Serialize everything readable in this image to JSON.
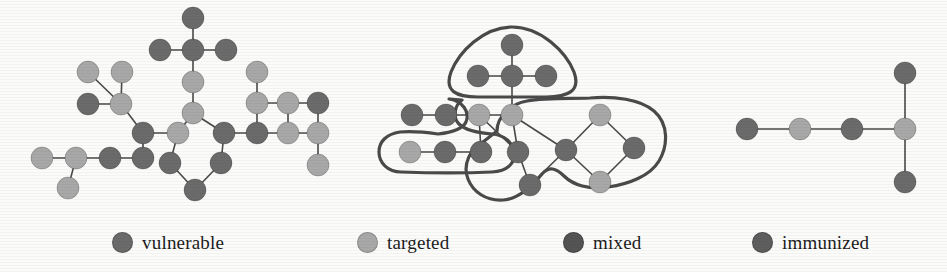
{
  "figure": {
    "title": "",
    "background_color": "#fbfbfa",
    "node_radius": 11,
    "edge_color": "#4a4a4a",
    "edge_width": 1.6,
    "blob_color": "#4a4a4a",
    "blob_width": 3.2
  },
  "colors": {
    "vulnerable": "#6b6b6b",
    "targeted": "#a8a8a8",
    "mixed": "#545454",
    "immunized": "#5e5e5e",
    "dark": "#6b6b6b",
    "light": "#a8a8a8",
    "edge": "#4a4a4a",
    "outline": "#4a4a4a"
  },
  "legend": {
    "items": [
      {
        "label": "vulnerable",
        "color": "#6b6b6b",
        "x": 112,
        "swatch": "circle-marker"
      },
      {
        "label": "targeted",
        "color": "#a8a8a8",
        "x": 357,
        "swatch": "circle-marker"
      },
      {
        "label": "mixed",
        "color": "#545454",
        "x": 563,
        "swatch": "circle-marker"
      },
      {
        "label": "immunized",
        "color": "#5e5e5e",
        "x": 752,
        "swatch": "circle-marker"
      }
    ]
  },
  "panels": [
    {
      "name": "panel-left",
      "caption": "",
      "blobs": [],
      "nodes": [
        {
          "id": "L1",
          "x": 193,
          "y": 18,
          "type": "dark"
        },
        {
          "id": "L2",
          "x": 160,
          "y": 50,
          "type": "dark"
        },
        {
          "id": "L3",
          "x": 193,
          "y": 50,
          "type": "dark"
        },
        {
          "id": "L4",
          "x": 226,
          "y": 50,
          "type": "dark"
        },
        {
          "id": "L5",
          "x": 193,
          "y": 82,
          "type": "light"
        },
        {
          "id": "L6",
          "x": 193,
          "y": 113,
          "type": "light"
        },
        {
          "id": "L7",
          "x": 88,
          "y": 72,
          "type": "light"
        },
        {
          "id": "L8",
          "x": 122,
          "y": 72,
          "type": "light"
        },
        {
          "id": "L9",
          "x": 88,
          "y": 104,
          "type": "dark"
        },
        {
          "id": "L10",
          "x": 121,
          "y": 104,
          "type": "light"
        },
        {
          "id": "L11",
          "x": 143,
          "y": 133,
          "type": "dark"
        },
        {
          "id": "L12",
          "x": 178,
          "y": 133,
          "type": "light"
        },
        {
          "id": "L13",
          "x": 42,
          "y": 158,
          "type": "light"
        },
        {
          "id": "L14",
          "x": 76,
          "y": 158,
          "type": "light"
        },
        {
          "id": "L15",
          "x": 68,
          "y": 188,
          "type": "light"
        },
        {
          "id": "L16",
          "x": 110,
          "y": 158,
          "type": "dark"
        },
        {
          "id": "L17",
          "x": 143,
          "y": 158,
          "type": "dark"
        },
        {
          "id": "L18",
          "x": 170,
          "y": 163,
          "type": "dark"
        },
        {
          "id": "L19",
          "x": 195,
          "y": 190,
          "type": "dark"
        },
        {
          "id": "L20",
          "x": 221,
          "y": 163,
          "type": "dark"
        },
        {
          "id": "L21",
          "x": 224,
          "y": 133,
          "type": "dark"
        },
        {
          "id": "L22",
          "x": 257,
          "y": 133,
          "type": "dark"
        },
        {
          "id": "L23",
          "x": 257,
          "y": 103,
          "type": "light"
        },
        {
          "id": "L24",
          "x": 257,
          "y": 72,
          "type": "light"
        },
        {
          "id": "L25",
          "x": 288,
          "y": 103,
          "type": "light"
        },
        {
          "id": "L26",
          "x": 288,
          "y": 133,
          "type": "light"
        },
        {
          "id": "L27",
          "x": 318,
          "y": 103,
          "type": "dark"
        },
        {
          "id": "L28",
          "x": 318,
          "y": 133,
          "type": "light"
        },
        {
          "id": "L29",
          "x": 318,
          "y": 165,
          "type": "light"
        }
      ],
      "edges": [
        [
          "L1",
          "L3"
        ],
        [
          "L2",
          "L3"
        ],
        [
          "L3",
          "L4"
        ],
        [
          "L3",
          "L5"
        ],
        [
          "L5",
          "L6"
        ],
        [
          "L6",
          "L12"
        ],
        [
          "L6",
          "L21"
        ],
        [
          "L7",
          "L10"
        ],
        [
          "L8",
          "L10"
        ],
        [
          "L9",
          "L10"
        ],
        [
          "L10",
          "L11"
        ],
        [
          "L11",
          "L12"
        ],
        [
          "L11",
          "L17"
        ],
        [
          "L12",
          "L18"
        ],
        [
          "L13",
          "L14"
        ],
        [
          "L14",
          "L15"
        ],
        [
          "L14",
          "L16"
        ],
        [
          "L16",
          "L17"
        ],
        [
          "L18",
          "L19"
        ],
        [
          "L19",
          "L20"
        ],
        [
          "L20",
          "L21"
        ],
        [
          "L21",
          "L22"
        ],
        [
          "L22",
          "L23"
        ],
        [
          "L22",
          "L26"
        ],
        [
          "L23",
          "L24"
        ],
        [
          "L23",
          "L25"
        ],
        [
          "L25",
          "L27"
        ],
        [
          "L25",
          "L26"
        ],
        [
          "L26",
          "L28"
        ],
        [
          "L27",
          "L28"
        ],
        [
          "L28",
          "L29"
        ]
      ]
    },
    {
      "name": "panel-middle",
      "caption": "",
      "nodes": [
        {
          "id": "M1",
          "x": 512,
          "y": 45,
          "type": "dark"
        },
        {
          "id": "M2",
          "x": 478,
          "y": 76,
          "type": "dark"
        },
        {
          "id": "M3",
          "x": 512,
          "y": 76,
          "type": "dark"
        },
        {
          "id": "M4",
          "x": 546,
          "y": 76,
          "type": "dark"
        },
        {
          "id": "M5",
          "x": 512,
          "y": 115,
          "type": "light"
        },
        {
          "id": "M6",
          "x": 446,
          "y": 115,
          "type": "dark"
        },
        {
          "id": "M7",
          "x": 412,
          "y": 115,
          "type": "dark"
        },
        {
          "id": "M8",
          "x": 479,
          "y": 115,
          "type": "light"
        },
        {
          "id": "M9",
          "x": 410,
          "y": 152,
          "type": "light"
        },
        {
          "id": "M10",
          "x": 445,
          "y": 152,
          "type": "dark"
        },
        {
          "id": "M11",
          "x": 481,
          "y": 152,
          "type": "dark"
        },
        {
          "id": "M12",
          "x": 518,
          "y": 152,
          "type": "dark"
        },
        {
          "id": "M13",
          "x": 530,
          "y": 185,
          "type": "dark"
        },
        {
          "id": "M14",
          "x": 566,
          "y": 150,
          "type": "dark"
        },
        {
          "id": "M15",
          "x": 600,
          "y": 115,
          "type": "light"
        },
        {
          "id": "M16",
          "x": 634,
          "y": 148,
          "type": "dark"
        },
        {
          "id": "M17",
          "x": 600,
          "y": 182,
          "type": "light"
        }
      ],
      "edges": [
        [
          "M1",
          "M3"
        ],
        [
          "M2",
          "M3"
        ],
        [
          "M3",
          "M4"
        ],
        [
          "M3",
          "M5"
        ],
        [
          "M5",
          "M8"
        ],
        [
          "M5",
          "M14"
        ],
        [
          "M5",
          "M12"
        ],
        [
          "M8",
          "M6"
        ],
        [
          "M6",
          "M7"
        ],
        [
          "M9",
          "M10"
        ],
        [
          "M10",
          "M11"
        ],
        [
          "M11",
          "M8"
        ],
        [
          "M12",
          "M13"
        ],
        [
          "M13",
          "M14"
        ],
        [
          "M14",
          "M15"
        ],
        [
          "M15",
          "M16"
        ],
        [
          "M16",
          "M17"
        ],
        [
          "M17",
          "M14"
        ],
        [
          "M12",
          "M8"
        ]
      ],
      "blobs": [
        {
          "id": "blob-top",
          "name": "cluster-outline-top"
        },
        {
          "id": "blob-left",
          "name": "cluster-outline-left"
        },
        {
          "id": "blob-right",
          "name": "cluster-outline-right"
        }
      ]
    },
    {
      "name": "panel-right",
      "caption": "",
      "blobs": [],
      "nodes": [
        {
          "id": "R1",
          "x": 747,
          "y": 129,
          "type": "dark"
        },
        {
          "id": "R2",
          "x": 800,
          "y": 129,
          "type": "light"
        },
        {
          "id": "R3",
          "x": 852,
          "y": 129,
          "type": "dark"
        },
        {
          "id": "R4",
          "x": 905,
          "y": 129,
          "type": "light"
        },
        {
          "id": "R5",
          "x": 905,
          "y": 73,
          "type": "dark"
        },
        {
          "id": "R6",
          "x": 905,
          "y": 182,
          "type": "dark"
        }
      ],
      "edges": [
        [
          "R1",
          "R2"
        ],
        [
          "R2",
          "R3"
        ],
        [
          "R3",
          "R4"
        ],
        [
          "R4",
          "R5"
        ],
        [
          "R4",
          "R6"
        ]
      ]
    }
  ]
}
